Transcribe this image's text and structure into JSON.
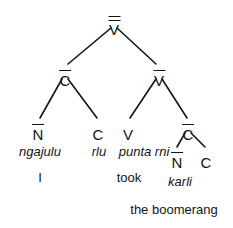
{
  "diagram": {
    "type": "syntactic-tree",
    "language_note": "Warlpiri",
    "background_color": "#ffffff",
    "line_color": "#141414",
    "text_color": "#141414"
  },
  "nodes": {
    "root": {
      "label": "V",
      "bars": 2,
      "x": 114,
      "y": 22
    },
    "left_cbar": {
      "label": "C",
      "bars": 1,
      "x": 65,
      "y": 73
    },
    "right_vbar": {
      "label": "V",
      "bars": 1,
      "x": 159,
      "y": 73
    },
    "nbar_left": {
      "label": "N",
      "bars": 1,
      "x": 38,
      "y": 127
    },
    "c_rlu": {
      "label": "C",
      "bars": 0,
      "x": 98,
      "y": 127
    },
    "v_punta": {
      "label": "V",
      "bars": 0,
      "x": 128,
      "y": 127
    },
    "cbar_right": {
      "label": "C",
      "bars": 1,
      "x": 188,
      "y": 127
    },
    "nbar_karli": {
      "label": "N",
      "bars": 1,
      "x": 177,
      "y": 155
    },
    "c_final": {
      "label": "C",
      "bars": 0,
      "x": 206,
      "y": 155
    }
  },
  "edges": [
    {
      "from": "root",
      "to": "left_cbar"
    },
    {
      "from": "root",
      "to": "right_vbar"
    },
    {
      "from": "left_cbar",
      "to": "nbar_left"
    },
    {
      "from": "left_cbar",
      "to": "c_rlu"
    },
    {
      "from": "right_vbar",
      "to": "v_punta"
    },
    {
      "from": "right_vbar",
      "to": "cbar_right"
    },
    {
      "from": "cbar_right",
      "to": "nbar_karli"
    },
    {
      "from": "cbar_right",
      "to": "c_final"
    }
  ],
  "words": [
    {
      "text": "ngajulu",
      "x": 40,
      "y": 145
    },
    {
      "text": "rlu",
      "x": 99,
      "y": 145
    },
    {
      "text": "punta rni",
      "x": 144,
      "y": 145
    },
    {
      "text": "karli",
      "x": 180,
      "y": 175
    }
  ],
  "glosses": [
    {
      "text": "I",
      "x": 40,
      "y": 171
    },
    {
      "text": "took",
      "x": 129,
      "y": 171
    },
    {
      "text": "the boomerang",
      "x": 174,
      "y": 203
    }
  ]
}
